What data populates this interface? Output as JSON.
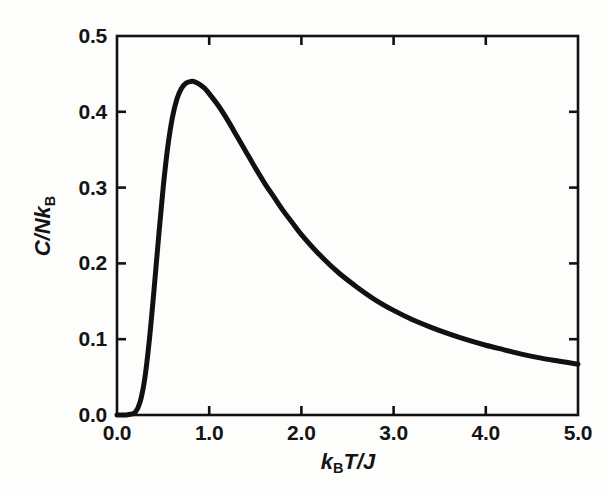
{
  "figure": {
    "background_color": "#fdfdfc",
    "ink_color": "#111111"
  },
  "axes": {
    "x_title_parts": {
      "symbol1": "k",
      "sub1": "B",
      "symbol2": "T",
      "slash": "/",
      "symbol3": "J"
    },
    "y_title_parts": {
      "symbol1": "C",
      "slash": "/",
      "symbol2": "N",
      "symbol3": "k",
      "sub1": "B"
    },
    "x_tick_labels": [
      "0.0",
      "1.0",
      "2.0",
      "3.0",
      "4.0",
      "5.0"
    ],
    "y_tick_labels": [
      "0.0",
      "0.1",
      "0.2",
      "0.3",
      "0.4",
      "0.5"
    ]
  },
  "chart_data": {
    "type": "line",
    "title": "",
    "xlabel": "kBT/J",
    "ylabel": "C/NkB",
    "xlim": [
      0.0,
      5.0
    ],
    "ylim": [
      0.0,
      0.5
    ],
    "xticks": [
      0.0,
      1.0,
      2.0,
      3.0,
      4.0,
      5.0
    ],
    "yticks": [
      0.0,
      0.1,
      0.2,
      0.3,
      0.4,
      0.5
    ],
    "grid": false,
    "legend": null,
    "frame": "box",
    "tick_direction": "in",
    "line_color": "#111111",
    "line_width_px": 5,
    "peak": {
      "x": 0.83,
      "y": 0.44
    },
    "series": [
      {
        "name": "heat capacity",
        "x": [
          0.0,
          0.05,
          0.1,
          0.15,
          0.2,
          0.25,
          0.3,
          0.35,
          0.4,
          0.45,
          0.5,
          0.55,
          0.6,
          0.65,
          0.7,
          0.75,
          0.8,
          0.83,
          0.9,
          0.95,
          1.0,
          1.1,
          1.2,
          1.3,
          1.4,
          1.5,
          1.6,
          1.7,
          1.8,
          1.9,
          2.0,
          2.2,
          2.4,
          2.6,
          2.8,
          3.0,
          3.2,
          3.4,
          3.6,
          3.8,
          4.0,
          4.2,
          4.4,
          4.6,
          4.8,
          5.0
        ],
        "y": [
          0.0,
          0.0,
          0.0,
          0.001,
          0.004,
          0.017,
          0.047,
          0.098,
          0.163,
          0.233,
          0.299,
          0.353,
          0.392,
          0.417,
          0.431,
          0.438,
          0.44,
          0.44,
          0.436,
          0.431,
          0.424,
          0.408,
          0.389,
          0.368,
          0.347,
          0.326,
          0.306,
          0.288,
          0.27,
          0.254,
          0.238,
          0.211,
          0.188,
          0.169,
          0.152,
          0.138,
          0.126,
          0.116,
          0.107,
          0.099,
          0.092,
          0.086,
          0.08,
          0.075,
          0.071,
          0.067
        ]
      }
    ]
  },
  "plot_geometry": {
    "left_px": 117,
    "right_px": 578,
    "top_px": 36,
    "bottom_px": 415
  }
}
